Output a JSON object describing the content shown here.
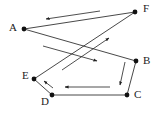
{
  "diagram": {
    "width": 160,
    "height": 113,
    "colors": {
      "edge": "#333333",
      "node": "#111111",
      "arrow": "#222222",
      "label": "#222222",
      "background": "#ffffff"
    },
    "nodes": [
      {
        "id": "A",
        "label": "A",
        "x": 24,
        "y": 29,
        "label_x": 9,
        "label_y": 31
      },
      {
        "id": "F",
        "label": "F",
        "x": 135,
        "y": 12,
        "label_x": 143,
        "label_y": 12
      },
      {
        "id": "B",
        "label": "B",
        "x": 136,
        "y": 61,
        "label_x": 143,
        "label_y": 64
      },
      {
        "id": "C",
        "label": "C",
        "x": 127,
        "y": 95,
        "label_x": 134,
        "label_y": 98
      },
      {
        "id": "D",
        "label": "D",
        "x": 52,
        "y": 95,
        "label_x": 41,
        "label_y": 105
      },
      {
        "id": "E",
        "label": "E",
        "x": 34,
        "y": 79,
        "label_x": 22,
        "label_y": 79
      }
    ],
    "edges": [
      {
        "from": "A",
        "to": "B"
      },
      {
        "from": "B",
        "to": "C"
      },
      {
        "from": "C",
        "to": "D"
      },
      {
        "from": "D",
        "to": "E"
      },
      {
        "from": "E",
        "to": "F"
      },
      {
        "from": "F",
        "to": "A"
      }
    ],
    "arrows": [
      {
        "name": "arrow-f-to-a",
        "x1": 100,
        "y1": 11,
        "x2": 46,
        "y2": 19
      },
      {
        "name": "arrow-a-to-b",
        "x1": 43,
        "y1": 46,
        "x2": 97,
        "y2": 61
      },
      {
        "name": "arrow-b-to-c",
        "x1": 125,
        "y1": 62,
        "x2": 120,
        "y2": 85
      },
      {
        "name": "arrow-c-to-d",
        "x1": 110,
        "y1": 87,
        "x2": 65,
        "y2": 87
      },
      {
        "name": "arrow-d-to-e",
        "x1": 53,
        "y1": 88,
        "x2": 44,
        "y2": 81
      },
      {
        "name": "arrow-e-to-f",
        "x1": 62,
        "y1": 70,
        "x2": 109,
        "y2": 38
      }
    ]
  }
}
